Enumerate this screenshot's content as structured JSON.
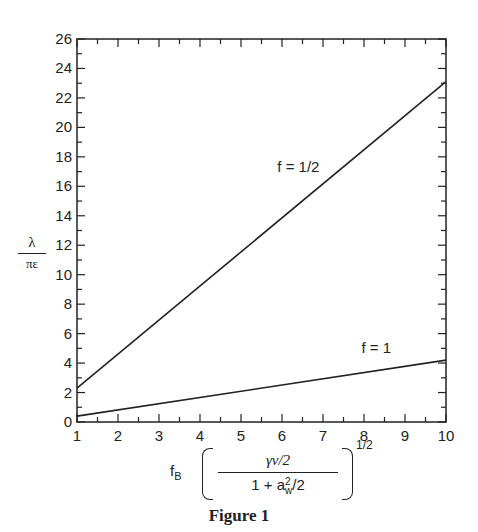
{
  "chart_data": {
    "type": "line",
    "title": "",
    "caption": "Figure 1",
    "xlabel": "f_B ( γν/2 / (1 + a_w²/2) )^(1/2)",
    "ylabel": "λ / πε",
    "xlim": [
      1,
      10
    ],
    "ylim": [
      0,
      26
    ],
    "x_ticks": [
      1,
      2,
      3,
      4,
      5,
      6,
      7,
      8,
      9,
      10
    ],
    "y_ticks": [
      0,
      2,
      4,
      6,
      8,
      10,
      12,
      14,
      16,
      18,
      20,
      22,
      24,
      26
    ],
    "grid": false,
    "legend": "none (inline annotations)",
    "series": [
      {
        "name": "f = 1/2",
        "x": [
          1,
          10
        ],
        "values": [
          2.3,
          23.1
        ],
        "label": "f = 1/2",
        "label_pos": [
          6.4,
          17.0
        ]
      },
      {
        "name": "f = 1",
        "x": [
          1,
          10
        ],
        "values": [
          0.4,
          4.2
        ],
        "label": "f = 1",
        "label_pos": [
          8.3,
          4.7
        ]
      }
    ]
  },
  "labels": {
    "y_num": "λ",
    "y_den": "πε",
    "x_fb": "f",
    "x_fb_sub": "B",
    "x_frac_num": "γν/2",
    "x_frac_den_a": "1 + a",
    "x_frac_den_sup": "2",
    "x_frac_den_sub": "w",
    "x_frac_den_b": "/2",
    "x_exp": "1/2",
    "caption": "Figure 1"
  }
}
